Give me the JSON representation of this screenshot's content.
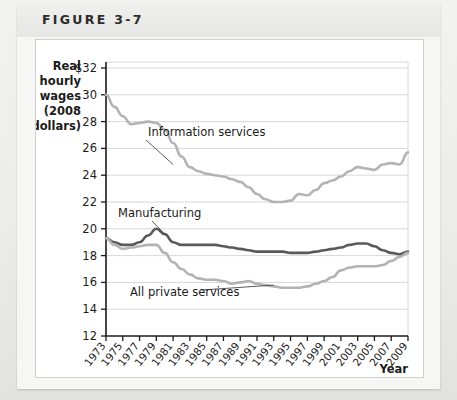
{
  "figure": {
    "label": "FIGURE 3-7"
  },
  "chart_data": {
    "type": "line",
    "title": "",
    "ylabel": "Real hourly wages (2008 dollars)",
    "ylabel_lines": [
      "Real",
      "hourly",
      "wages",
      "(2008",
      "dollars)"
    ],
    "xlabel": "Year",
    "ylim": [
      12,
      32
    ],
    "ytick_values": [
      32,
      30,
      28,
      26,
      24,
      22,
      20,
      18,
      16,
      14,
      12
    ],
    "ytick_labels": [
      "$32",
      "30",
      "28",
      "26",
      "24",
      "22",
      "20",
      "18",
      "16",
      "14",
      "12"
    ],
    "xlim": [
      1973,
      2009
    ],
    "xtick_labels": [
      "1973",
      "1975",
      "1977",
      "1979",
      "1981",
      "1983",
      "1985",
      "1987",
      "1989",
      "1991",
      "1993",
      "1995",
      "1997",
      "1999",
      "2001",
      "2003",
      "2005",
      "2007",
      "2009"
    ],
    "grid": "horizontal",
    "legend_position": "inline-annotations",
    "x": [
      1973,
      1974,
      1975,
      1976,
      1977,
      1978,
      1979,
      1980,
      1981,
      1982,
      1983,
      1984,
      1985,
      1986,
      1987,
      1988,
      1989,
      1990,
      1991,
      1992,
      1993,
      1994,
      1995,
      1996,
      1997,
      1998,
      1999,
      2000,
      2001,
      2002,
      2003,
      2004,
      2005,
      2006,
      2007,
      2008,
      2009
    ],
    "series": [
      {
        "name": "Information services",
        "color": "#b3b3b3",
        "values": [
          30.0,
          29.1,
          28.4,
          27.8,
          27.9,
          28.0,
          27.9,
          27.4,
          26.4,
          25.4,
          24.6,
          24.3,
          24.1,
          24.0,
          23.9,
          23.7,
          23.5,
          23.1,
          22.6,
          22.2,
          22.0,
          22.0,
          22.1,
          22.6,
          22.5,
          22.9,
          23.4,
          23.6,
          23.9,
          24.3,
          24.6,
          24.5,
          24.4,
          24.8,
          24.9,
          24.8,
          25.7
        ]
      },
      {
        "name": "Manufacturing",
        "color": "#595959",
        "values": [
          19.3,
          19.0,
          18.8,
          18.8,
          19.0,
          19.5,
          20.0,
          19.6,
          19.0,
          18.8,
          18.8,
          18.8,
          18.8,
          18.8,
          18.7,
          18.6,
          18.5,
          18.4,
          18.3,
          18.3,
          18.3,
          18.3,
          18.2,
          18.2,
          18.2,
          18.3,
          18.4,
          18.5,
          18.6,
          18.8,
          18.9,
          18.9,
          18.7,
          18.4,
          18.2,
          18.1,
          18.3
        ]
      },
      {
        "name": "All private services",
        "color": "#b3b3b3",
        "values": [
          19.3,
          18.8,
          18.5,
          18.6,
          18.7,
          18.8,
          18.8,
          18.2,
          17.5,
          17.0,
          16.6,
          16.3,
          16.2,
          16.2,
          16.1,
          15.9,
          16.0,
          16.1,
          15.9,
          15.8,
          15.7,
          15.6,
          15.6,
          15.6,
          15.7,
          15.9,
          16.1,
          16.4,
          16.9,
          17.1,
          17.2,
          17.2,
          17.2,
          17.3,
          17.6,
          17.9,
          18.2
        ]
      }
    ],
    "annotations": [
      {
        "text": "Information services",
        "target_year": 1981,
        "target_value": 24.8
      },
      {
        "text": "Manufacturing",
        "target_year": 1980,
        "target_value": 19.6
      },
      {
        "text": "All private services",
        "target_year": 1993,
        "target_value": 15.8
      }
    ]
  }
}
